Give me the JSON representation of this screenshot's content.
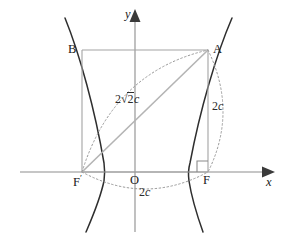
{
  "figure": {
    "kind": "geometry-diagram",
    "background_color": "#ffffff",
    "axes": {
      "x_label": "x",
      "y_label": "y",
      "origin_label": "O",
      "axis_color": "#8a8a8a",
      "x_axis_y": 172,
      "y_axis_x": 135
    },
    "points": [
      {
        "name": "B",
        "label": "B",
        "x": 82,
        "y": 50
      },
      {
        "name": "A",
        "label": "A",
        "x": 208,
        "y": 50
      },
      {
        "name": "F-prime",
        "label": "F",
        "prime": true,
        "x": 82,
        "y": 172
      },
      {
        "name": "F",
        "label": "F",
        "prime": false,
        "x": 208,
        "y": 172
      },
      {
        "name": "O",
        "label": "O",
        "x": 135,
        "y": 172
      }
    ],
    "measures": [
      {
        "name": "diagonal",
        "text_prefix": "2",
        "radicand": "2",
        "text_suffix": "c",
        "display": "2√2c",
        "x": 118,
        "y": 96
      },
      {
        "name": "vertical-side",
        "display": "2c",
        "number": "2",
        "variable": "c",
        "x": 208,
        "y": 104
      },
      {
        "name": "focal-distance",
        "display": "2c",
        "number": "2",
        "variable": "c",
        "x": 143,
        "y": 189
      }
    ],
    "colors": {
      "curve": "#2e2e2e",
      "axis": "#8d8d8d",
      "rect": "#a0a0a0",
      "diagonal": "#b0b0b0",
      "dotted": "#9a9a9a",
      "label": "#1a1a1a"
    },
    "annotations": {
      "right_angle_at": "F",
      "right_angle_size": 10
    }
  }
}
